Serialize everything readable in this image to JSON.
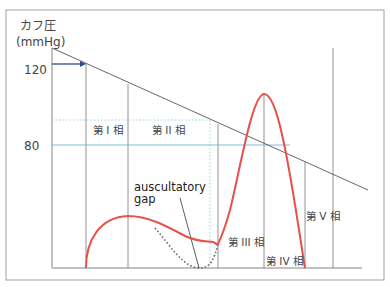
{
  "y_axis": {
    "label_line1": "カフ圧",
    "label_line2": "(mmHg)",
    "ticks": [
      "120",
      "80"
    ]
  },
  "phases": [
    {
      "label": "第 I 相"
    },
    {
      "label": "第 II 相"
    },
    {
      "label": "第 III 相"
    },
    {
      "label": "第 IV 相"
    },
    {
      "label": "第 V 相"
    }
  ],
  "annotation": {
    "line1": "auscultatory",
    "line2": "gap"
  },
  "colors": {
    "sound_curve": "#e8504a",
    "gap_dotted": "#666666",
    "systolic_arrow": "#2a4d8f",
    "diastolic_line": "#7fb9e3",
    "dotted_guide": "#8fd3e0",
    "frame": "#888888",
    "cuff_pressure_line": "#555555"
  }
}
